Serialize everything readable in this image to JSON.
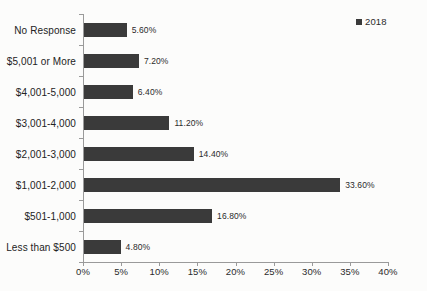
{
  "chart_data": {
    "type": "bar",
    "orientation": "horizontal",
    "title": "",
    "subtitle": "",
    "xlabel": "",
    "ylabel": "",
    "categories": [
      "No Response",
      "$5,001 or More",
      "$4,001-5,000",
      "$3,001-4,000",
      "$2,001-3,000",
      "$1,001-2,000",
      "$501-1,000",
      "Less than $500"
    ],
    "series": [
      {
        "name": "2018",
        "values": [
          5.6,
          7.2,
          6.4,
          11.2,
          14.4,
          33.6,
          16.8,
          4.8
        ],
        "value_labels": [
          "5.60%",
          "7.20%",
          "6.40%",
          "11.20%",
          "14.40%",
          "33.60%",
          "16.80%",
          "4.80%"
        ],
        "color": "#3a3a3a"
      }
    ],
    "xlim": [
      0,
      40
    ],
    "xticks": [
      0,
      5,
      10,
      15,
      20,
      25,
      30,
      35,
      40
    ],
    "xtick_labels": [
      "0%",
      "5%",
      "10%",
      "15%",
      "20%",
      "25%",
      "30%",
      "35%",
      "40%"
    ],
    "grid": false,
    "legend": {
      "position": "top-right",
      "entries": [
        {
          "label": "2018",
          "color": "#3a3a3a"
        }
      ]
    },
    "axis_color": "#9a9a9a",
    "background": "#fcfcfb"
  }
}
